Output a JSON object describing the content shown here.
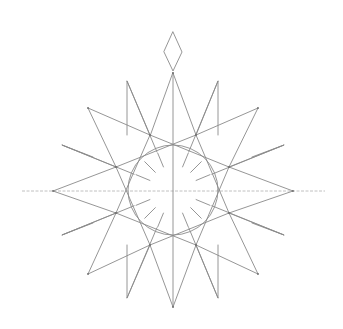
{
  "image": {
    "subject": "pencil sketch of a compass rose star",
    "background": "#ffffff",
    "stroke_color": "#8a8a8a"
  },
  "drawing": {
    "center": [
      173,
      190
    ],
    "circle_radius": 45,
    "tick_inner_radius": 25,
    "tick_outer_radius": 40,
    "tick_count": 16,
    "diamond": [
      [
        173,
        32
      ],
      [
        182,
        52
      ],
      [
        173,
        71
      ],
      [
        164,
        52
      ]
    ],
    "main_star": [
      [
        173,
        73
      ],
      [
        196,
        135
      ],
      [
        258,
        108
      ],
      [
        229,
        167
      ],
      [
        293,
        191
      ],
      [
        229,
        213
      ],
      [
        258,
        274
      ],
      [
        196,
        245
      ],
      [
        173,
        307
      ],
      [
        150,
        245
      ],
      [
        88,
        274
      ],
      [
        116,
        213
      ],
      [
        53,
        191
      ],
      [
        116,
        167
      ],
      [
        88,
        108
      ],
      [
        150,
        135
      ]
    ],
    "secondary_points": [
      {
        "tip": [
          127,
          81
        ],
        "a": [
          150,
          135
        ],
        "b": [
          127,
          135
        ]
      },
      {
        "tip": [
          218,
          81
        ],
        "a": [
          196,
          135
        ],
        "b": [
          218,
          135
        ]
      },
      {
        "tip": [
          62,
          145
        ],
        "a": [
          116,
          167
        ],
        "b": [
          93,
          157
        ]
      },
      {
        "tip": [
          284,
          145
        ],
        "a": [
          229,
          167
        ],
        "b": [
          252,
          157
        ]
      },
      {
        "tip": [
          62,
          235
        ],
        "a": [
          116,
          213
        ],
        "b": [
          93,
          223
        ]
      },
      {
        "tip": [
          284,
          235
        ],
        "a": [
          229,
          213
        ],
        "b": [
          252,
          223
        ]
      },
      {
        "tip": [
          127,
          298
        ],
        "a": [
          150,
          245
        ],
        "b": [
          127,
          245
        ]
      },
      {
        "tip": [
          218,
          298
        ],
        "a": [
          196,
          245
        ],
        "b": [
          218,
          245
        ]
      }
    ],
    "axis_lines": {
      "horizontal": [
        [
          22,
          191
        ],
        [
          325,
          191
        ]
      ],
      "vertical": [
        [
          173,
          73
        ],
        [
          173,
          307
        ]
      ]
    }
  }
}
